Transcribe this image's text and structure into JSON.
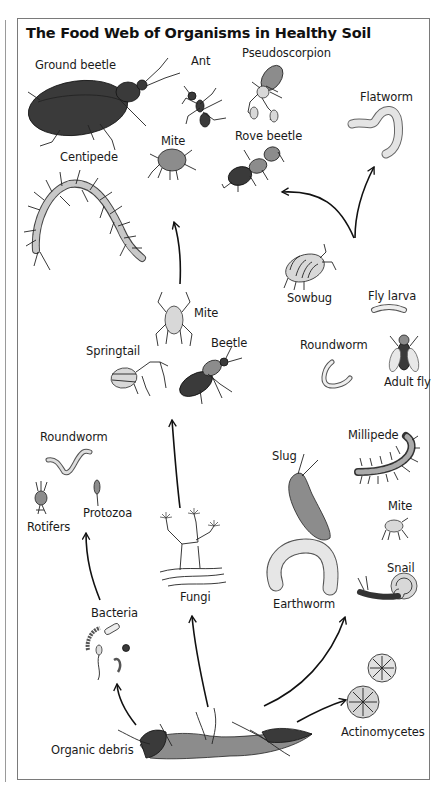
{
  "diagram": {
    "title": "The Food Web of Organisms in Healthy Soil",
    "nodes": [
      {
        "id": "ground-beetle",
        "label": "Ground beetle"
      },
      {
        "id": "ant",
        "label": "Ant"
      },
      {
        "id": "pseudoscorpion",
        "label": "Pseudoscorpion"
      },
      {
        "id": "flatworm",
        "label": "Flatworm"
      },
      {
        "id": "mite-top",
        "label": "Mite"
      },
      {
        "id": "rove-beetle",
        "label": "Rove beetle"
      },
      {
        "id": "centipede",
        "label": "Centipede"
      },
      {
        "id": "sowbug",
        "label": "Sowbug"
      },
      {
        "id": "fly-larva",
        "label": "Fly larva"
      },
      {
        "id": "mite-mid",
        "label": "Mite"
      },
      {
        "id": "springtail",
        "label": "Springtail"
      },
      {
        "id": "beetle",
        "label": "Beetle"
      },
      {
        "id": "roundworm-right",
        "label": "Roundworm"
      },
      {
        "id": "adult-fly",
        "label": "Adult fly"
      },
      {
        "id": "roundworm-left",
        "label": "Roundworm"
      },
      {
        "id": "rotifers",
        "label": "Rotifers"
      },
      {
        "id": "protozoa",
        "label": "Protozoa"
      },
      {
        "id": "slug",
        "label": "Slug"
      },
      {
        "id": "millipede",
        "label": "Millipede"
      },
      {
        "id": "mite-low",
        "label": "Mite"
      },
      {
        "id": "snail",
        "label": "Snail"
      },
      {
        "id": "fungi",
        "label": "Fungi"
      },
      {
        "id": "earthworm",
        "label": "Earthworm"
      },
      {
        "id": "bacteria",
        "label": "Bacteria"
      },
      {
        "id": "actinomycetes",
        "label": "Actinomycetes"
      },
      {
        "id": "organic-debris",
        "label": "Organic debris"
      }
    ],
    "edges": [
      {
        "from": "organic-debris",
        "to": "bacteria"
      },
      {
        "from": "organic-debris",
        "to": "fungi"
      },
      {
        "from": "organic-debris",
        "to": "earthworm"
      },
      {
        "from": "organic-debris",
        "to": "actinomycetes"
      },
      {
        "from": "bacteria",
        "to": "protozoa"
      },
      {
        "from": "fungi",
        "to": "springtail"
      },
      {
        "from": "mite-mid",
        "to": "mite-top"
      },
      {
        "from": "sowbug",
        "to": "rove-beetle"
      },
      {
        "from": "sowbug",
        "to": "flatworm"
      }
    ],
    "colors": {
      "line": "#111111",
      "frame": "#7a7a7a",
      "background": "#ffffff"
    }
  }
}
